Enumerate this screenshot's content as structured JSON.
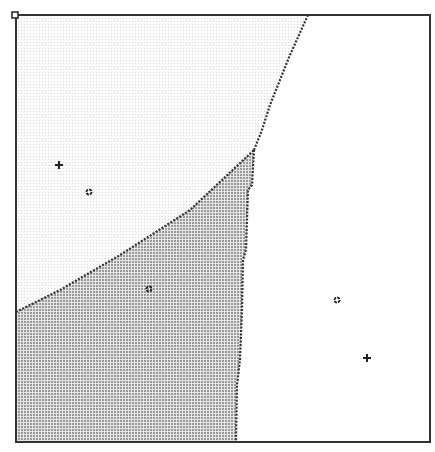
{
  "figure": {
    "frame": {
      "x0": 16,
      "y0": 15,
      "x1": 430,
      "y1": 442
    },
    "regions": [
      {
        "name": "upper-left-region",
        "fill": "light-dotted",
        "color": "#f4f4f4"
      },
      {
        "name": "lower-left-region",
        "fill": "dense-dotted",
        "color": "#c8c8c8"
      },
      {
        "name": "right-region",
        "fill": "white",
        "color": "#ffffff"
      }
    ],
    "boundaries": [
      {
        "name": "boundary-upper-diagonal",
        "points": [
          [
            308,
            15
          ],
          [
            290,
            55
          ],
          [
            270,
            105
          ],
          [
            262,
            130
          ],
          [
            254,
            150
          ]
        ]
      },
      {
        "name": "boundary-left-diagonal",
        "points": [
          [
            16,
            312
          ],
          [
            60,
            290
          ],
          [
            120,
            255
          ],
          [
            190,
            210
          ],
          [
            254,
            150
          ]
        ]
      },
      {
        "name": "boundary-vertical",
        "points": [
          [
            254,
            150
          ],
          [
            252,
            185
          ],
          [
            248,
            190
          ],
          [
            246,
            250
          ],
          [
            243,
            260
          ],
          [
            242,
            310
          ],
          [
            240,
            360
          ],
          [
            237,
            385
          ],
          [
            236,
            442
          ]
        ]
      }
    ],
    "points": [
      {
        "name": "plus-point-1",
        "marker": "plus",
        "x": 59,
        "y": 165
      },
      {
        "name": "circle-point-1",
        "marker": "circle",
        "x": 89,
        "y": 192
      },
      {
        "name": "circle-point-2",
        "marker": "circle",
        "x": 149,
        "y": 289
      },
      {
        "name": "circle-point-3",
        "marker": "circle",
        "x": 337,
        "y": 300
      },
      {
        "name": "plus-point-2",
        "marker": "plus",
        "x": 367,
        "y": 358
      }
    ],
    "corner_handle": {
      "x": 15,
      "y": 15
    }
  }
}
